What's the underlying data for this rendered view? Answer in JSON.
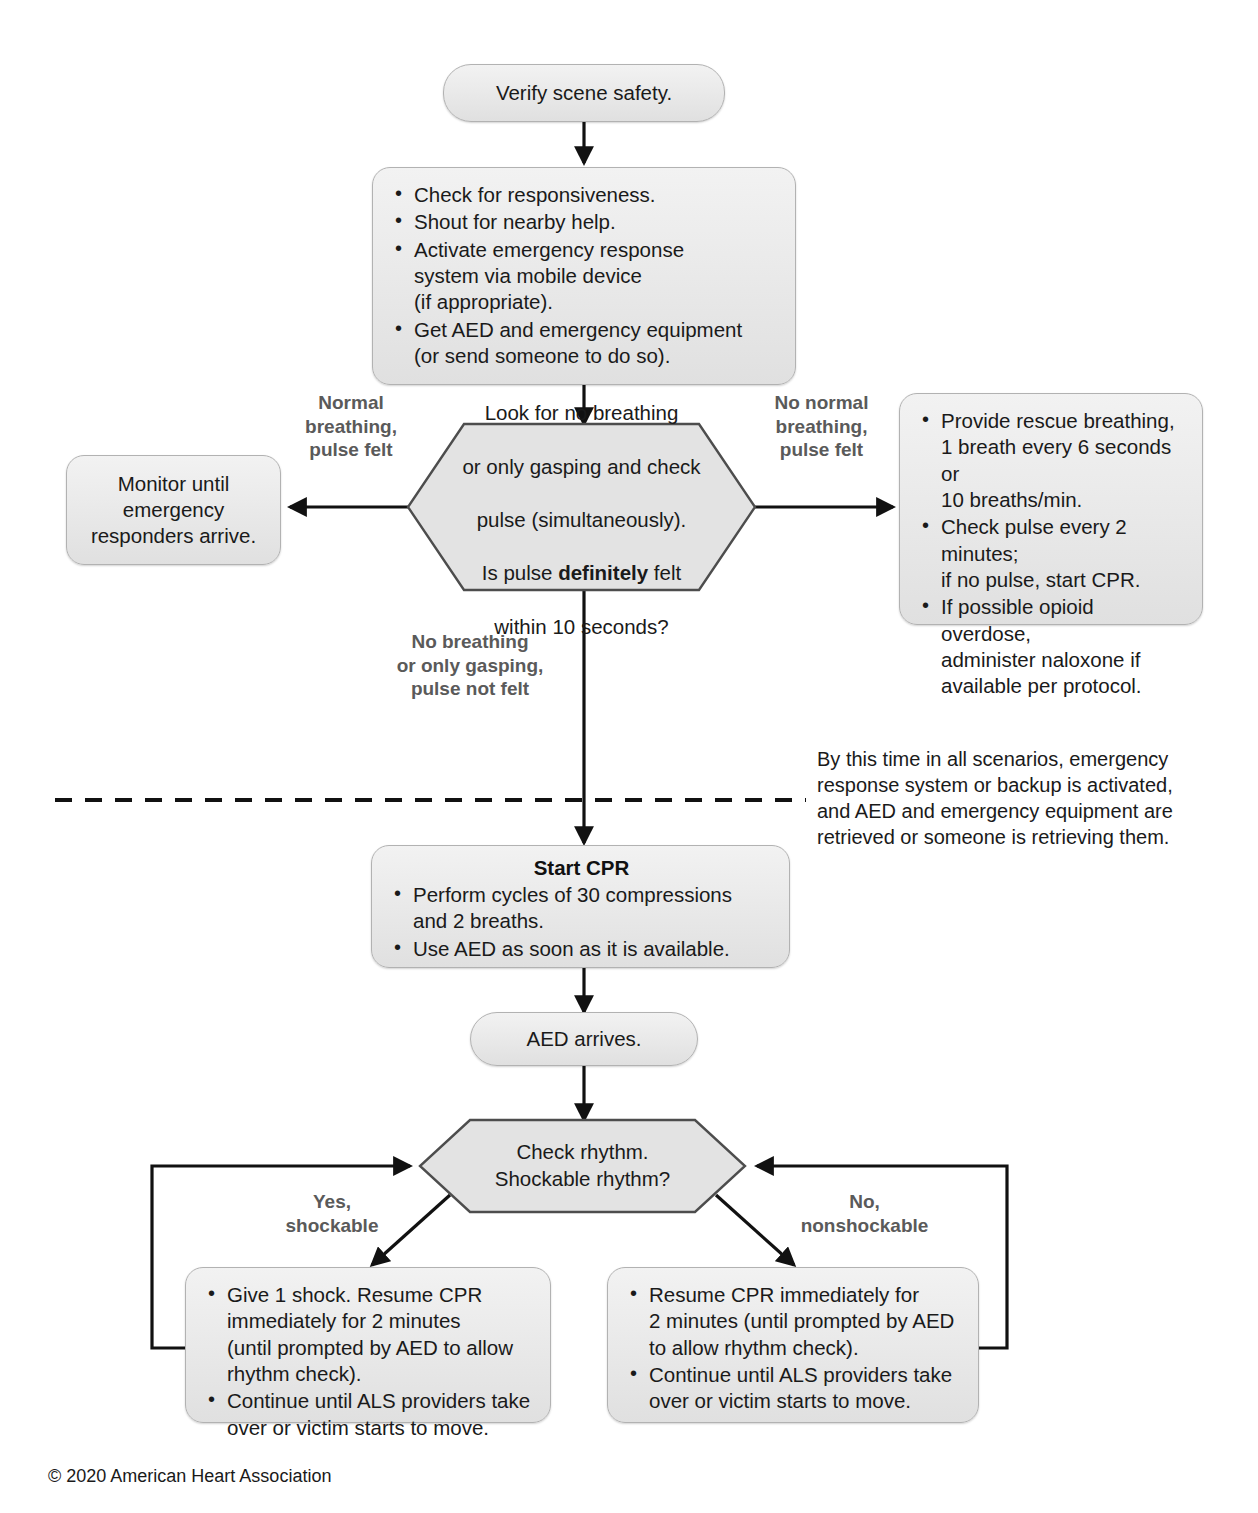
{
  "document": {
    "title": "Adult Basic Life Support Algorithm for Healthcare Providers",
    "copyright": "© 2020 American Heart Association"
  },
  "colors": {
    "node_fill_top": "#f2f2f2",
    "node_fill_bottom": "#e0e0e0",
    "node_border": "#b2b2b2",
    "hex_fill": "#e3e3e3",
    "hex_border": "#4d4d4d",
    "edge_stroke": "#111111",
    "label_text": "#5a5a5a",
    "body_text": "#1a1a1a"
  },
  "nodes": {
    "verify_scene": {
      "id": "verify-scene-safety",
      "shape": "pill",
      "text": "Verify scene safety."
    },
    "initial_assessment": {
      "id": "initial-assessment",
      "shape": "rounded-rect",
      "bullets": [
        "Check for responsiveness.",
        "Shout for nearby help.",
        "Activate emergency response\nsystem via mobile device\n(if appropriate).",
        "Get AED and emergency equipment\n(or send someone to do so)."
      ]
    },
    "breathing_pulse_check": {
      "id": "breathing-pulse-decision",
      "shape": "hexagon",
      "line1": "Look for no breathing",
      "line2": "or only gasping and check",
      "line3": "pulse (simultaneously).",
      "line4_pre": "Is pulse ",
      "line4_bold": "definitely",
      "line4_post": " felt",
      "line5": "within 10 seconds?"
    },
    "monitor": {
      "id": "monitor-until-responders",
      "shape": "rounded-rect",
      "text": "Monitor until\nemergency\nresponders arrive."
    },
    "rescue_breathing": {
      "id": "rescue-breathing",
      "shape": "rounded-rect",
      "bullets": [
        "Provide rescue breathing,\n1 breath every 6 seconds or\n10 breaths/min.",
        "Check pulse every 2 minutes;\nif no pulse, start CPR.",
        "If possible opioid overdose,\nadminister naloxone if\navailable per protocol."
      ]
    },
    "start_cpr": {
      "id": "start-cpr",
      "shape": "rounded-rect",
      "title": "Start CPR",
      "bullets": [
        "Perform cycles of 30 compressions\nand 2 breaths.",
        "Use AED as soon as it is available."
      ]
    },
    "aed_arrives": {
      "id": "aed-arrives",
      "shape": "pill",
      "text": "AED arrives."
    },
    "check_rhythm": {
      "id": "check-rhythm-decision",
      "shape": "hexagon",
      "text": "Check rhythm.\nShockable rhythm?"
    },
    "shockable_action": {
      "id": "shockable-action",
      "shape": "rounded-rect",
      "bullets": [
        "Give 1 shock. Resume CPR\nimmediately for 2 minutes\n(until prompted by AED to allow\nrhythm check).",
        "Continue until ALS providers take\nover or victim starts to move."
      ]
    },
    "nonshockable_action": {
      "id": "nonshockable-action",
      "shape": "rounded-rect",
      "bullets": [
        "Resume CPR immediately for\n2 minutes (until prompted by AED\nto allow rhythm check).",
        "Continue until ALS providers take\nover or victim starts to move."
      ]
    }
  },
  "edge_labels": {
    "normal_breathing": "Normal\nbreathing,\npulse felt",
    "no_normal_breathing": "No normal\nbreathing,\npulse felt",
    "no_breathing_no_pulse": "No breathing\nor only gasping,\npulse not felt",
    "yes_shockable": "Yes,\nshockable",
    "no_nonshockable": "No,\nnonshockable"
  },
  "annotations": {
    "divider_note": "By this time in all scenarios, emergency\nresponse system or backup is activated,\nand AED and emergency equipment are\nretrieved or someone is retrieving them."
  }
}
